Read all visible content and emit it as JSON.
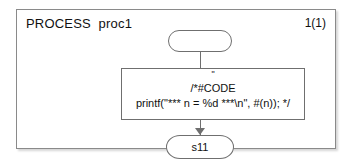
{
  "diagram": {
    "type": "sdl-process-diagram",
    "title": "PROCESS  proc1",
    "page_number": "1(1)",
    "symbols": {
      "start": {
        "kind": "start-symbol",
        "label": ""
      },
      "task": {
        "kind": "task-symbol",
        "quote_mark": "\"",
        "code_line_1": "/*#CODE",
        "code_line_2": "printf(\"*** n = %d ***\\n\", #(n)); */",
        "text": "/*#CODE\nprintf(\"*** n = %d ***\\n\", #(n)); */"
      },
      "state": {
        "kind": "state-symbol",
        "label": "s11"
      }
    },
    "connectors": [
      {
        "from": "start",
        "to": "task",
        "arrow": false
      },
      {
        "from": "task",
        "to": "state",
        "arrow": true
      }
    ],
    "colors": {
      "line": "#6f6f6f",
      "frame": "#8a8a8a",
      "text": "#111111",
      "background": "#ffffff"
    }
  }
}
